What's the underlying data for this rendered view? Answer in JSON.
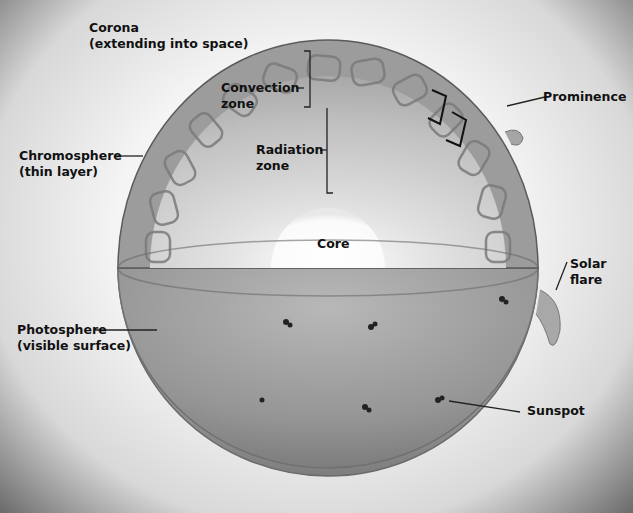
{
  "diagram": {
    "labels": {
      "corona": {
        "line1": "Corona",
        "line2": "(extending into space)"
      },
      "convection_zone": {
        "line1": "Convection",
        "line2": "zone"
      },
      "prominence": {
        "line1": "Prominence"
      },
      "chromosphere": {
        "line1": "Chromosphere",
        "line2": "(thin layer)"
      },
      "radiation_zone": {
        "line1": "Radiation",
        "line2": "zone"
      },
      "core": {
        "line1": "Core"
      },
      "solar_flare": {
        "line1": "Solar",
        "line2": "flare"
      },
      "photosphere": {
        "line1": "Photosphere",
        "line2": "(visible surface)"
      },
      "sunspot": {
        "line1": "Sunspot"
      }
    },
    "colors": {
      "sun_body": "#9a9a9a",
      "interior": "#c4c4c4",
      "core": "#fafafa",
      "text": "#111111"
    }
  }
}
